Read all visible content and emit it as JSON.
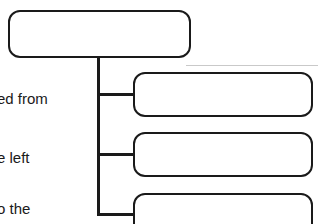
{
  "diagram": {
    "type": "org-tree",
    "orientation": "root-top-children-right",
    "background_color": "#ffffff",
    "line_color": "#1a1a1a",
    "node_fill_color": "#ffffff",
    "text_color": "#1a1a1a",
    "nodes": [
      {
        "id": "root",
        "label": "",
        "role": "parent-node"
      },
      {
        "id": "child-1",
        "label": "",
        "role": "child-node"
      },
      {
        "id": "child-2",
        "label": "",
        "role": "child-node"
      },
      {
        "id": "child-3",
        "label": "",
        "role": "child-node"
      }
    ],
    "connectors": [
      {
        "id": "trunk",
        "kind": "vertical-stem",
        "from": "root",
        "to": "branch-bus"
      },
      {
        "id": "branch-1",
        "kind": "horizontal-elbow",
        "from": "trunk",
        "to": "child-1"
      },
      {
        "id": "branch-2",
        "kind": "horizontal-elbow",
        "from": "trunk",
        "to": "child-2"
      },
      {
        "id": "branch-3",
        "kind": "horizontal-elbow",
        "from": "trunk",
        "to": "child-3"
      }
    ]
  },
  "captions": {
    "line_1": "ed from",
    "line_2": "e left",
    "line_3": "o the"
  }
}
